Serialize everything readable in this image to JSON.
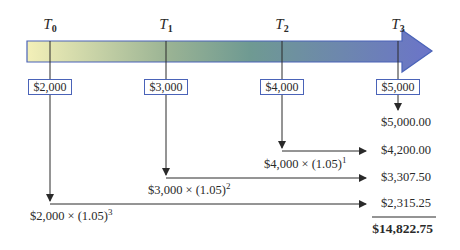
{
  "diagram": {
    "colors": {
      "arrow_start": "#f3f0b8",
      "arrow_mid": "#6f9a92",
      "arrow_end": "#6b74c9",
      "box_border": "#4a63b8",
      "line": "#2a2a2a"
    },
    "timeline": [
      {
        "label": "T",
        "sub": "0",
        "cash_flow": "$2,000"
      },
      {
        "label": "T",
        "sub": "1",
        "cash_flow": "$3,000"
      },
      {
        "label": "T",
        "sub": "2",
        "cash_flow": "$4,000"
      },
      {
        "label": "T",
        "sub": "3",
        "cash_flow": "$5,000"
      }
    ],
    "formulas": [
      {
        "text": "$4,000 × (1.05)",
        "exp": "1"
      },
      {
        "text": "$3,000 × (1.05)",
        "exp": "2"
      },
      {
        "text": "$2,000 × (1.05)",
        "exp": "3"
      }
    ],
    "values": [
      "$5,000.00",
      "$4,200.00",
      "$3,307.50",
      "$2,315.25"
    ],
    "total": "$14,822.75"
  }
}
